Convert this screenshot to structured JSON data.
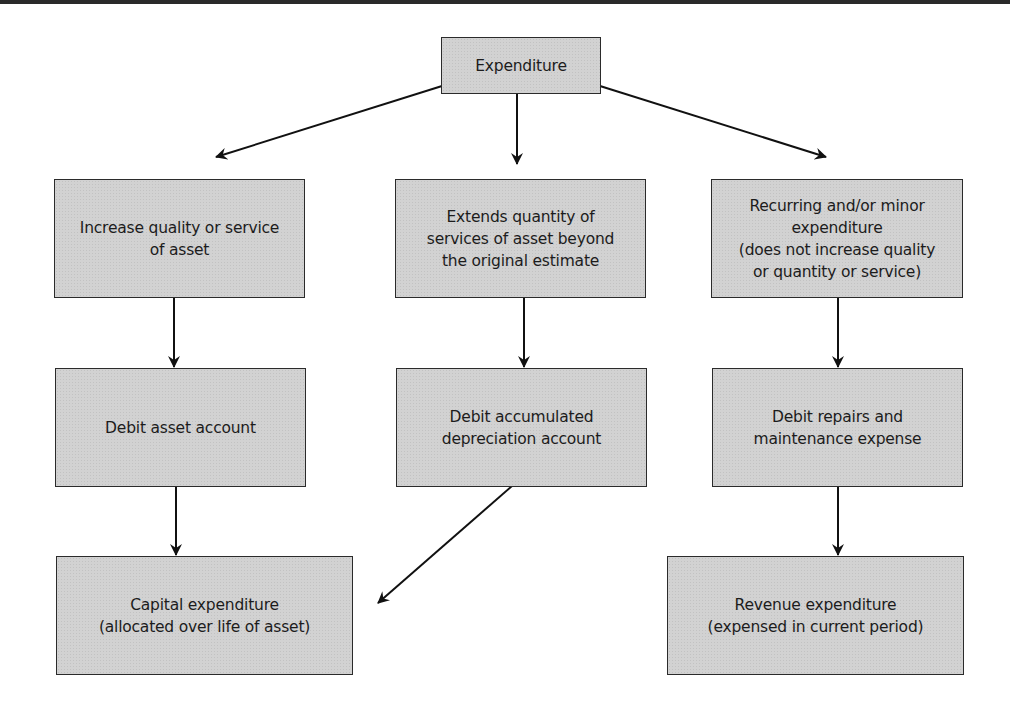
{
  "diagram": {
    "root": {
      "label": "Expenditure"
    },
    "row1": [
      {
        "label": "Increase quality or service\nof asset"
      },
      {
        "label": "Extends quantity of\nservices of asset beyond\nthe original estimate"
      },
      {
        "label": "Recurring and/or minor\nexpenditure\n(does not increase quality\nor quantity or service)"
      }
    ],
    "row2": [
      {
        "label": "Debit asset account"
      },
      {
        "label": "Debit accumulated\ndepreciation account"
      },
      {
        "label": "Debit repairs and\nmaintenance expense"
      }
    ],
    "row3": [
      {
        "label": "Capital expenditure\n(allocated over life of asset)"
      },
      {
        "label": "Revenue expenditure\n(expensed in current period)"
      }
    ],
    "edges": [
      {
        "from": "Expenditure",
        "to": "Increase quality or service of asset"
      },
      {
        "from": "Expenditure",
        "to": "Extends quantity of services of asset beyond the original estimate"
      },
      {
        "from": "Expenditure",
        "to": "Recurring and/or minor expenditure"
      },
      {
        "from": "Increase quality or service of asset",
        "to": "Debit asset account"
      },
      {
        "from": "Extends quantity of services of asset beyond the original estimate",
        "to": "Debit accumulated depreciation account"
      },
      {
        "from": "Recurring and/or minor expenditure",
        "to": "Debit repairs and maintenance expense"
      },
      {
        "from": "Debit asset account",
        "to": "Capital expenditure"
      },
      {
        "from": "Debit accumulated depreciation account",
        "to": "Capital expenditure"
      },
      {
        "from": "Debit repairs and maintenance expense",
        "to": "Revenue expenditure"
      }
    ],
    "colors": {
      "box_fill": "#d2d2d2",
      "border": "#2b2b2b",
      "text": "#1c1c1c",
      "arrow": "#111111"
    }
  }
}
